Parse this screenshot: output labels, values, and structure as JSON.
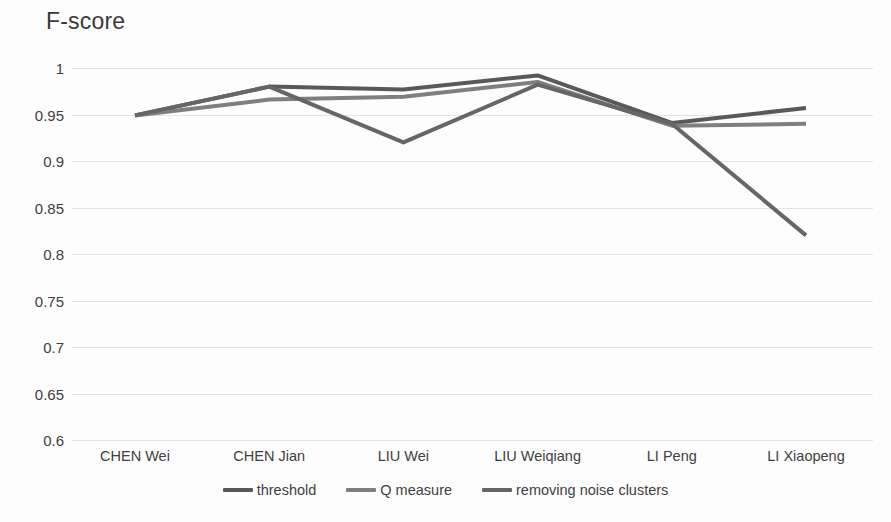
{
  "chart_data": {
    "type": "line",
    "title": "F-score",
    "xlabel": "",
    "ylabel": "F-score",
    "categories": [
      "CHEN Wei",
      "CHEN Jian",
      "LIU Wei",
      "LIU Weiqiang",
      "LI Peng",
      "LI Xiaopeng"
    ],
    "yticks": [
      "1",
      "0.95",
      "0.9",
      "0.85",
      "0.8",
      "0.75",
      "0.7",
      "0.65",
      "0.6"
    ],
    "ytick_values": [
      1,
      0.95,
      0.9,
      0.85,
      0.8,
      0.75,
      0.7,
      0.65,
      0.6
    ],
    "ylim": [
      0.6,
      1.0
    ],
    "grid": true,
    "legend_position": "bottom",
    "series": [
      {
        "name": "threshold",
        "color": "#595959",
        "values": [
          0.949,
          0.98,
          0.977,
          0.992,
          0.941,
          0.957
        ]
      },
      {
        "name": "Q measure",
        "color": "#7f7f7f",
        "values": [
          0.949,
          0.966,
          0.969,
          0.985,
          0.938,
          0.94
        ]
      },
      {
        "name": "removing noise clusters",
        "color": "#666666",
        "values": [
          0.949,
          0.98,
          0.92,
          0.982,
          0.94,
          0.82
        ]
      }
    ]
  },
  "colors": {
    "gridline": "#e4e4e6",
    "text": "#3f3f3f",
    "background": "#fdfdfd"
  }
}
